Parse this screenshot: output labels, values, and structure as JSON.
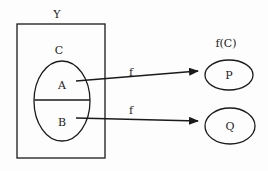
{
  "diagram": {
    "set_label": "Y",
    "subset_label": "C",
    "part_a": "A",
    "part_b": "B",
    "image_label": "f(C)",
    "target_p": "P",
    "target_q": "Q",
    "arrow_top_label": "f",
    "arrow_bottom_label": "f",
    "stroke_color": "#1a1a1a"
  }
}
